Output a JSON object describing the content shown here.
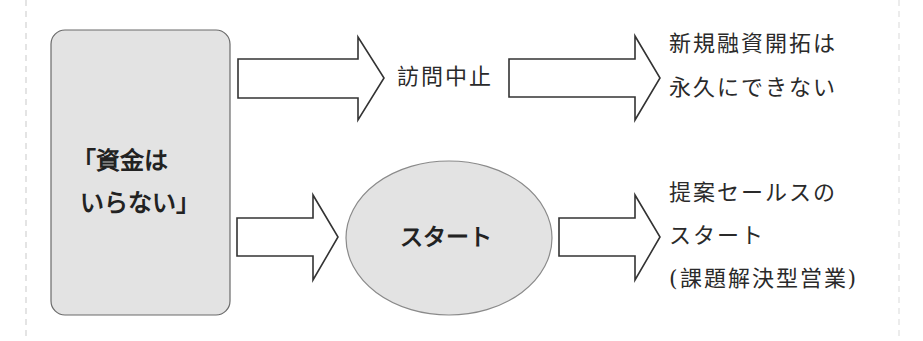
{
  "diagram": {
    "source_box": {
      "lines": [
        "「資金は",
        "いらない」"
      ],
      "fill": "#e3e3e3",
      "border": "#666666"
    },
    "top_path": {
      "middle_label": "訪問中止",
      "result_lines": [
        "新規融資開拓は",
        "永久にできない"
      ]
    },
    "bottom_path": {
      "middle_label": "スタート",
      "result_lines": [
        "提案セールスの",
        "スタート",
        "(課題解決型営業)"
      ]
    },
    "colors": {
      "arrow_stroke": "#333333",
      "ellipse_fill": "#e3e3e3",
      "ellipse_stroke": "#888888",
      "text": "#2a2a2a",
      "guide_dashes": "#e6e6e6"
    }
  }
}
